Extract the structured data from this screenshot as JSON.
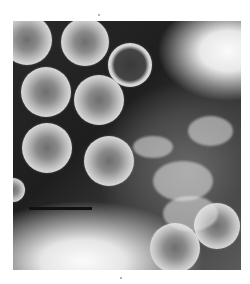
{
  "image": {
    "description": "Negative-stain electron micrograph of spherical virus particles with radial spoke-like capsid structure",
    "colormode": "grayscale",
    "scale_bar": {
      "visible": true,
      "label": ""
    },
    "particles": [
      {
        "x": 27,
        "y": 40,
        "r": 25
      },
      {
        "x": 85,
        "y": 42,
        "r": 24
      },
      {
        "x": 130,
        "y": 65,
        "r": 22,
        "type": "ring"
      },
      {
        "x": 46,
        "y": 92,
        "r": 25
      },
      {
        "x": 99,
        "y": 100,
        "r": 25
      },
      {
        "x": 47,
        "y": 148,
        "r": 25
      },
      {
        "x": 109,
        "y": 161,
        "r": 25
      },
      {
        "x": 217,
        "y": 226,
        "r": 23
      },
      {
        "x": 175,
        "y": 248,
        "r": 25
      },
      {
        "x": 13,
        "y": 190,
        "r": 12
      }
    ]
  }
}
